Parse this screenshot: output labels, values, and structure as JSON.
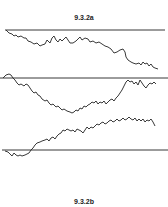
{
  "figure": {
    "label_top": "9.3.2a",
    "label_bottom": "9.3.2b",
    "line_color": "#222222",
    "barriers": [
      {
        "name": "barrier-1",
        "y": 30
      },
      {
        "name": "barrier-2",
        "y": 78
      },
      {
        "name": "barrier-3",
        "y": 150
      }
    ],
    "paths": [
      {
        "name": "path-1",
        "description": "random walk starting at top barrier drifting downward"
      },
      {
        "name": "path-2",
        "description": "random walk starting at barrier, dipping down then returning near barrier"
      },
      {
        "name": "path-3",
        "description": "random walk starting at lower barrier rising upward"
      }
    ]
  }
}
